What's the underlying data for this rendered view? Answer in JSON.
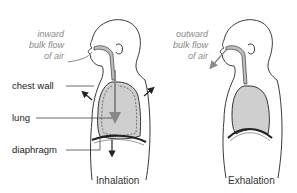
{
  "diagram": {
    "panels": [
      {
        "id": "inhalation",
        "caption": "Inhalation",
        "flow_label": [
          "inward",
          "bulk flow",
          "of air"
        ]
      },
      {
        "id": "exhalation",
        "caption": "Exhalation",
        "flow_label": [
          "outward",
          "bulk  flow",
          "of air"
        ]
      }
    ],
    "labels": {
      "chest_wall": "chest wall",
      "lung": "lung",
      "diaphragm": "diaphragm"
    },
    "colors": {
      "outline": "#222222",
      "lung_fill": "#cfcfcf",
      "airway_fill": "#bdbdbd",
      "flow_text": "#8a8a8a",
      "arrow_gray": "#888888"
    }
  }
}
